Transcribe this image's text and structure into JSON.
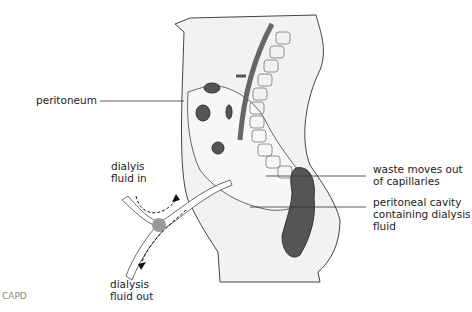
{
  "diagram": {
    "title": "CAPD",
    "labels": {
      "peritoneum": "peritoneum",
      "fluid_in": "dialyis\nfluid in",
      "fluid_out": "dialysis\nfluid out",
      "waste": "waste moves out\nof capillaries",
      "cavity": "peritoneal cavity\ncontaining dialysis\nfluid"
    },
    "colors": {
      "body_fill": "#f2f2f2",
      "outline": "#444444",
      "catheter_fill": "#ffffff",
      "organ_dark": "#555555",
      "valve": "#999999",
      "spine_bar": "#666666",
      "caption": "#888888"
    }
  }
}
